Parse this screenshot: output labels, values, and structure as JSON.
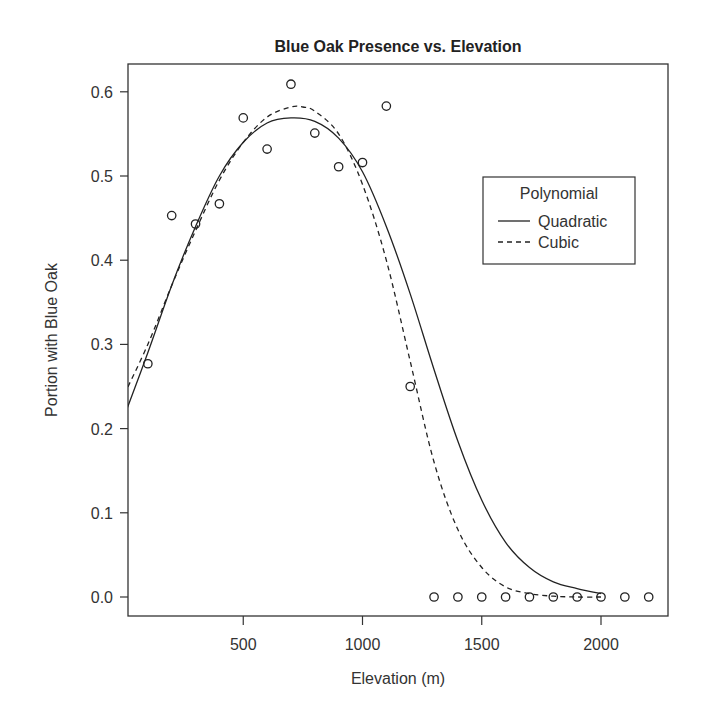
{
  "chart_data": {
    "type": "scatter",
    "title": "Blue Oak Presence vs. Elevation",
    "xlabel": "Elevation (m)",
    "ylabel": "Portion with Blue Oak",
    "xlim": [
      0,
      2250
    ],
    "ylim": [
      -0.02,
      0.63
    ],
    "x_ticks": [
      500,
      1000,
      1500,
      2000
    ],
    "x_tick_labels": [
      "500",
      "1000",
      "1500",
      "2000"
    ],
    "y_ticks": [
      0.0,
      0.1,
      0.2,
      0.3,
      0.4,
      0.5,
      0.6
    ],
    "y_tick_labels": [
      "0.0",
      "0.1",
      "0.2",
      "0.3",
      "0.4",
      "0.5",
      "0.6"
    ],
    "grid": false,
    "points": {
      "name": "Observed",
      "marker": "open-circle",
      "x": [
        100,
        200,
        300,
        400,
        500,
        600,
        700,
        800,
        900,
        1000,
        1100,
        1200,
        1300,
        1400,
        1500,
        1600,
        1700,
        1800,
        1900,
        2000,
        2100,
        2200
      ],
      "y": [
        0.277,
        0.453,
        0.443,
        0.467,
        0.569,
        0.532,
        0.609,
        0.551,
        0.511,
        0.516,
        0.583,
        0.25,
        0,
        0,
        0,
        0,
        0,
        0,
        0,
        0,
        0,
        0
      ]
    },
    "series": [
      {
        "name": "Quadratic",
        "line_style": "solid",
        "x": [
          0,
          100,
          200,
          300,
          400,
          500,
          600,
          700,
          800,
          900,
          1000,
          1100,
          1200,
          1300,
          1400,
          1500,
          1600,
          1700,
          1800,
          1900,
          2000
        ],
        "values": [
          0.214,
          0.29,
          0.37,
          0.44,
          0.5,
          0.54,
          0.563,
          0.569,
          0.565,
          0.545,
          0.505,
          0.44,
          0.36,
          0.27,
          0.185,
          0.115,
          0.065,
          0.035,
          0.018,
          0.01,
          0.004
        ]
      },
      {
        "name": "Cubic",
        "line_style": "dashed",
        "x": [
          0,
          100,
          200,
          300,
          400,
          500,
          600,
          700,
          750,
          800,
          900,
          1000,
          1100,
          1200,
          1300,
          1400,
          1500,
          1600,
          1700,
          1800,
          1900,
          2000
        ],
        "values": [
          0.24,
          0.3,
          0.37,
          0.435,
          0.495,
          0.54,
          0.57,
          0.582,
          0.582,
          0.577,
          0.55,
          0.49,
          0.4,
          0.28,
          0.16,
          0.08,
          0.035,
          0.012,
          0.004,
          0.001,
          0.0,
          0.0
        ]
      }
    ],
    "legend": {
      "title": "Polynomial",
      "entries": [
        {
          "label": "Quadratic",
          "line_style": "solid"
        },
        {
          "label": "Cubic",
          "line_style": "dashed"
        }
      ],
      "position": "right-middle-upper"
    }
  },
  "colors": {
    "line": "#222222",
    "axis": "#333333",
    "background": "#ffffff"
  }
}
